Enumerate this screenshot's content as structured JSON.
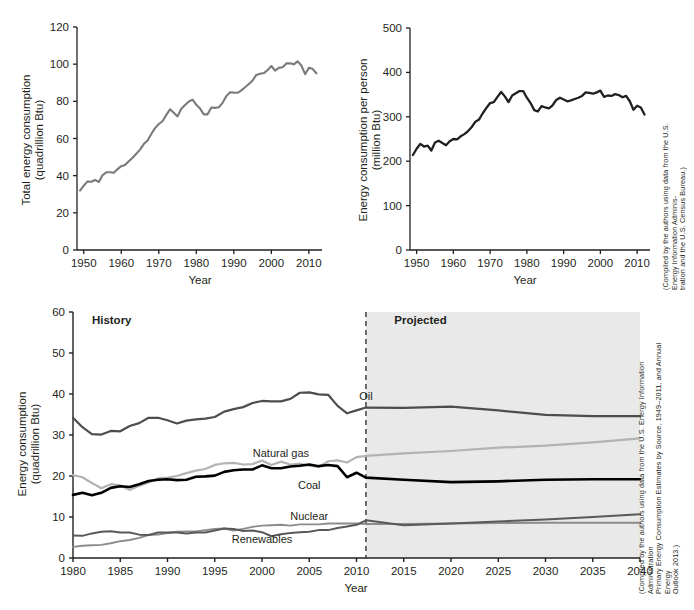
{
  "figure": {
    "panels": [
      "total-energy-consumption",
      "energy-consumption-per-person",
      "energy-consumption-by-source"
    ]
  },
  "panel1": {
    "ylabel_line1": "Total energy consumption",
    "ylabel_line2": "(quadrillion Btu)",
    "xlabel": "Year",
    "caption": "(Compiled by the authors using data from the U.S. Energy Information Adminis-\ntration and the U.S. Census Bureau.)"
  },
  "panel2": {
    "ylabel_line1": "Energy consumption per person",
    "ylabel_line2": "(million Btu)",
    "xlabel": "Year"
  },
  "panel3": {
    "ylabel_line1": "Energy consumption",
    "ylabel_line2": "(quadrillion Btu)",
    "xlabel": "Year",
    "history_label": "History",
    "projected_label": "Projected",
    "divider_year": 2011,
    "caption": "(Compiled by the authors using data from the U.S. Energy Information Administration\nPrimary Energy Consumption Estimates by Source, 1949–2011, and Annual Energy\nOutlook 2013.)"
  },
  "colors": {
    "oil": "#4d4d4d",
    "natural_gas": "#b3b3b3",
    "coal": "#000000",
    "nuclear": "#8c8c8c",
    "renewables": "#595959",
    "total_line": "#7a7a7a",
    "per_person_line": "#231f20",
    "projection_band": "#e9e9e9",
    "axis": "#231f20"
  },
  "chart_data": [
    {
      "type": "line",
      "name": "total-energy-consumption",
      "title": "",
      "xlabel": "Year",
      "ylabel": "Total energy consumption (quadrillion Btu)",
      "xlim": [
        1949,
        2012
      ],
      "ylim": [
        0,
        120
      ],
      "xticks": [
        1950,
        1960,
        1970,
        1980,
        1990,
        2000,
        2010
      ],
      "yticks": [
        0,
        20,
        40,
        60,
        80,
        100,
        120
      ],
      "grid": false,
      "legend": "none",
      "series": [
        {
          "name": "Total energy consumption",
          "color": "#7a7a7a",
          "x": [
            1949,
            1950,
            1951,
            1952,
            1953,
            1954,
            1955,
            1956,
            1957,
            1958,
            1959,
            1960,
            1961,
            1962,
            1963,
            1964,
            1965,
            1966,
            1967,
            1968,
            1969,
            1970,
            1971,
            1972,
            1973,
            1974,
            1975,
            1976,
            1977,
            1978,
            1979,
            1980,
            1981,
            1982,
            1983,
            1984,
            1985,
            1986,
            1987,
            1988,
            1989,
            1990,
            1991,
            1992,
            1993,
            1994,
            1995,
            1996,
            1997,
            1998,
            1999,
            2000,
            2001,
            2002,
            2003,
            2004,
            2005,
            2006,
            2007,
            2008,
            2009,
            2010,
            2011,
            2012
          ],
          "values": [
            32.0,
            34.6,
            36.9,
            36.7,
            37.7,
            36.6,
            40.2,
            41.8,
            41.8,
            41.6,
            43.5,
            45.1,
            45.7,
            47.8,
            49.6,
            51.8,
            54.0,
            57.0,
            58.9,
            62.4,
            65.6,
            67.8,
            69.3,
            72.7,
            75.7,
            73.9,
            71.9,
            76.0,
            78.0,
            79.9,
            80.9,
            78.1,
            76.1,
            73.0,
            73.0,
            76.7,
            76.5,
            76.8,
            79.2,
            82.8,
            84.9,
            84.7,
            84.6,
            85.9,
            87.6,
            89.3,
            91.2,
            94.2,
            94.8,
            95.2,
            96.8,
            99.0,
            96.5,
            98.0,
            98.3,
            100.4,
            100.5,
            99.9,
            101.5,
            99.3,
            94.6,
            98.0,
            97.5,
            95.1
          ]
        }
      ]
    },
    {
      "type": "line",
      "name": "energy-consumption-per-person",
      "title": "",
      "xlabel": "Year",
      "ylabel": "Energy consumption per person (million Btu)",
      "xlim": [
        1949,
        2012
      ],
      "ylim": [
        0,
        500
      ],
      "xticks": [
        1950,
        1960,
        1970,
        1980,
        1990,
        2000,
        2010
      ],
      "yticks": [
        0,
        100,
        200,
        300,
        400,
        500
      ],
      "grid": false,
      "legend": "none",
      "series": [
        {
          "name": "Energy consumption per person",
          "color": "#231f20",
          "x": [
            1949,
            1950,
            1951,
            1952,
            1953,
            1954,
            1955,
            1956,
            1957,
            1958,
            1959,
            1960,
            1961,
            1962,
            1963,
            1964,
            1965,
            1966,
            1967,
            1968,
            1969,
            1970,
            1971,
            1972,
            1973,
            1974,
            1975,
            1976,
            1977,
            1978,
            1979,
            1980,
            1981,
            1982,
            1983,
            1984,
            1985,
            1986,
            1987,
            1988,
            1989,
            1990,
            1991,
            1992,
            1993,
            1994,
            1995,
            1996,
            1997,
            1998,
            1999,
            2000,
            2001,
            2002,
            2003,
            2004,
            2005,
            2006,
            2007,
            2008,
            2009,
            2010,
            2011,
            2012
          ],
          "values": [
            214,
            228,
            239,
            233,
            235,
            224,
            242,
            246,
            241,
            236,
            245,
            250,
            249,
            256,
            261,
            268,
            277,
            289,
            294,
            308,
            320,
            331,
            333,
            345,
            356,
            346,
            333,
            348,
            353,
            358,
            358,
            343,
            331,
            315,
            312,
            324,
            321,
            319,
            326,
            338,
            343,
            339,
            335,
            337,
            340,
            343,
            347,
            355,
            354,
            352,
            355,
            359,
            345,
            348,
            347,
            351,
            349,
            344,
            347,
            335,
            316,
            325,
            321,
            305
          ]
        }
      ]
    },
    {
      "type": "line",
      "name": "energy-consumption-by-source",
      "title": "",
      "xlabel": "Year",
      "ylabel": "Energy consumption (quadrillion Btu)",
      "xlim": [
        1980,
        2040
      ],
      "ylim": [
        0,
        60
      ],
      "xticks": [
        1980,
        1985,
        1990,
        1995,
        2000,
        2005,
        2010,
        2015,
        2020,
        2025,
        2030,
        2035,
        2040
      ],
      "yticks": [
        0,
        10,
        20,
        30,
        40,
        50,
        60
      ],
      "grid": false,
      "legend": "inline-labels",
      "annotations": [
        {
          "text": "History",
          "x": 1982,
          "y": 58
        },
        {
          "text": "Projected",
          "x": 2014,
          "y": 58
        }
      ],
      "series": [
        {
          "name": "Oil",
          "label": "Oil",
          "color": "#4d4d4d",
          "label_x": 2011,
          "label_y": 39.5,
          "x": [
            1980,
            1981,
            1982,
            1983,
            1984,
            1985,
            1986,
            1987,
            1988,
            1989,
            1990,
            1991,
            1992,
            1993,
            1994,
            1995,
            1996,
            1997,
            1998,
            1999,
            2000,
            2001,
            2002,
            2003,
            2004,
            2005,
            2006,
            2007,
            2008,
            2009,
            2010,
            2011,
            2015,
            2020,
            2025,
            2030,
            2035,
            2040
          ],
          "values": [
            34.2,
            31.9,
            30.2,
            30.1,
            31.0,
            30.9,
            32.2,
            32.9,
            34.2,
            34.2,
            33.6,
            32.8,
            33.5,
            33.8,
            34.0,
            34.4,
            35.7,
            36.3,
            36.8,
            37.8,
            38.3,
            38.2,
            38.2,
            38.8,
            40.3,
            40.4,
            39.9,
            39.8,
            37.1,
            35.3,
            36.0,
            36.7,
            36.6,
            36.9,
            36.0,
            34.9,
            34.6,
            34.6
          ]
        },
        {
          "name": "Natural gas",
          "label": "Natural gas",
          "color": "#b3b3b3",
          "label_x": 2002,
          "label_y": 25.6,
          "x": [
            1980,
            1981,
            1982,
            1983,
            1984,
            1985,
            1986,
            1987,
            1988,
            1989,
            1990,
            1991,
            1992,
            1993,
            1994,
            1995,
            1996,
            1997,
            1998,
            1999,
            2000,
            2001,
            2002,
            2003,
            2004,
            2005,
            2006,
            2007,
            2008,
            2009,
            2010,
            2011,
            2015,
            2020,
            2025,
            2030,
            2035,
            2040
          ],
          "values": [
            20.2,
            19.7,
            18.3,
            17.0,
            18.0,
            17.7,
            16.6,
            17.6,
            18.4,
            19.4,
            19.6,
            20.0,
            20.7,
            21.3,
            21.7,
            22.7,
            23.1,
            23.2,
            22.8,
            22.9,
            23.8,
            22.7,
            23.5,
            22.8,
            23.0,
            22.5,
            22.2,
            23.6,
            23.8,
            23.3,
            24.6,
            24.9,
            25.5,
            26.1,
            26.9,
            27.4,
            28.2,
            29.2
          ]
        },
        {
          "name": "Coal",
          "label": "Coal",
          "color": "#000000",
          "label_x": 2005,
          "label_y": 17.8,
          "x": [
            1980,
            1981,
            1982,
            1983,
            1984,
            1985,
            1986,
            1987,
            1988,
            1989,
            1990,
            1991,
            1992,
            1993,
            1994,
            1995,
            1996,
            1997,
            1998,
            1999,
            2000,
            2001,
            2002,
            2003,
            2004,
            2005,
            2006,
            2007,
            2008,
            2009,
            2010,
            2011,
            2015,
            2020,
            2025,
            2030,
            2035,
            2040
          ],
          "values": [
            15.4,
            15.9,
            15.3,
            15.9,
            17.1,
            17.5,
            17.3,
            18.0,
            18.8,
            19.1,
            19.2,
            19.0,
            19.1,
            19.8,
            19.9,
            20.1,
            21.0,
            21.4,
            21.6,
            21.6,
            22.6,
            21.9,
            21.9,
            22.3,
            22.5,
            22.8,
            22.4,
            22.7,
            22.4,
            19.7,
            20.8,
            19.6,
            19.1,
            18.5,
            18.7,
            19.1,
            19.2,
            19.2
          ]
        },
        {
          "name": "Nuclear",
          "label": "Nuclear",
          "color": "#8c8c8c",
          "label_x": 2005,
          "label_y": 10.3,
          "x": [
            1980,
            1981,
            1982,
            1983,
            1984,
            1985,
            1986,
            1987,
            1988,
            1989,
            1990,
            1991,
            1992,
            1993,
            1994,
            1995,
            1996,
            1997,
            1998,
            1999,
            2000,
            2001,
            2002,
            2003,
            2004,
            2005,
            2006,
            2007,
            2008,
            2009,
            2010,
            2011,
            2015,
            2020,
            2025,
            2030,
            2035,
            2040
          ],
          "values": [
            2.7,
            3.0,
            3.1,
            3.2,
            3.6,
            4.1,
            4.4,
            4.9,
            5.6,
            5.7,
            6.1,
            6.4,
            6.5,
            6.5,
            6.8,
            7.1,
            7.2,
            6.7,
            7.1,
            7.6,
            7.9,
            8.0,
            8.1,
            7.9,
            8.2,
            8.2,
            8.2,
            8.4,
            8.4,
            8.4,
            8.4,
            8.3,
            8.3,
            8.4,
            8.5,
            8.6,
            8.6,
            8.6
          ]
        },
        {
          "name": "Renewables",
          "label": "Renewables",
          "color": "#595959",
          "label_x": 2000,
          "label_y": 4.6,
          "x": [
            1980,
            1981,
            1982,
            1983,
            1984,
            1985,
            1986,
            1987,
            1988,
            1989,
            1990,
            1991,
            1992,
            1993,
            1994,
            1995,
            1996,
            1997,
            1998,
            1999,
            2000,
            2001,
            2002,
            2003,
            2004,
            2005,
            2006,
            2007,
            2008,
            2009,
            2010,
            2011,
            2015,
            2020,
            2025,
            2030,
            2035,
            2040
          ],
          "values": [
            5.5,
            5.4,
            6.0,
            6.4,
            6.5,
            6.2,
            6.2,
            5.7,
            5.6,
            6.2,
            6.2,
            6.2,
            6.0,
            6.2,
            6.2,
            6.7,
            7.2,
            7.1,
            6.6,
            6.7,
            6.3,
            5.3,
            5.8,
            6.1,
            6.3,
            6.4,
            6.8,
            6.8,
            7.3,
            7.7,
            8.1,
            9.2,
            8.0,
            8.4,
            8.9,
            9.4,
            10.0,
            10.7
          ]
        }
      ]
    }
  ]
}
